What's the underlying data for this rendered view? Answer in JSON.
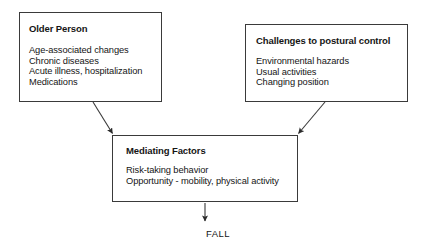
{
  "diagram": {
    "title_text": "",
    "background_color": "#ffffff",
    "line_color": "#3a3a3a",
    "text_color": "#151515",
    "nodes": [
      {
        "id": "older-person",
        "title": "Older Person",
        "items": [
          "Age-associated changes",
          "Chronic diseases",
          "Acute illness, hospitalization",
          "Medications"
        ]
      },
      {
        "id": "challenges",
        "title": "Challenges to postural control",
        "items": [
          "Environmental hazards",
          "Usual activities",
          "Changing position"
        ]
      },
      {
        "id": "mediating",
        "title": "Mediating Factors",
        "items": [
          "Risk-taking behavior",
          "Opportunity - mobility, physical activity"
        ]
      }
    ],
    "outcome_label": "FALL",
    "edges": [
      {
        "from": "older-person",
        "to": "mediating"
      },
      {
        "from": "challenges",
        "to": "mediating"
      },
      {
        "from": "mediating",
        "to": "FALL"
      }
    ]
  }
}
